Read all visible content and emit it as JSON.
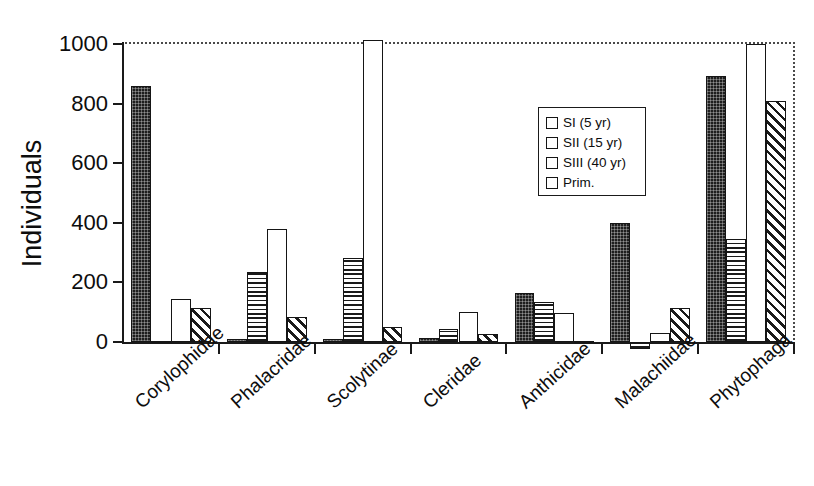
{
  "chart_data": {
    "type": "bar",
    "title": "",
    "subtitle": "",
    "xlabel": "",
    "ylabel": "Individuals",
    "ylim": [
      0,
      1000
    ],
    "yticks": [
      0,
      200,
      400,
      600,
      800,
      1000
    ],
    "ytick_labels": [
      "0",
      "200",
      "400",
      "600",
      "800",
      "1000"
    ],
    "grid": false,
    "legend_position": "upper-center-right",
    "categories": [
      "Corylophidae",
      "Phalacridae",
      "Scolytinae",
      "Cleridae",
      "Anthicidae",
      "Malachiidae",
      "Phytophaga"
    ],
    "series": [
      {
        "name": "SI (5 yr)",
        "fill": "solid-dark",
        "values": [
          860,
          10,
          10,
          12,
          163,
          400,
          893
        ]
      },
      {
        "name": "SII (15 yr)",
        "fill": "horizontal-stripes",
        "values": [
          5,
          235,
          282,
          42,
          133,
          -22,
          345
        ]
      },
      {
        "name": "SIII (40 yr)",
        "fill": "white",
        "values": [
          145,
          378,
          1015,
          100,
          98,
          30,
          1000
        ]
      },
      {
        "name": "Prim.",
        "fill": "diagonal-hatch",
        "values": [
          115,
          85,
          50,
          27,
          3,
          115,
          810
        ]
      }
    ],
    "colors": {
      "series_si": "#1e1e1e",
      "series_sii": "#1a1a1a",
      "series_siii": "#ffffff",
      "series_prim": "#1a1a1a",
      "axis": "#1a1a1a",
      "text": "#0d0d0d",
      "background": "#ffffff"
    }
  },
  "legend": {
    "entries": [
      {
        "label": "SI (5 yr)"
      },
      {
        "label": "SII (15 yr)"
      },
      {
        "label": "SIII (40 yr)"
      },
      {
        "label": "Prim."
      }
    ]
  }
}
